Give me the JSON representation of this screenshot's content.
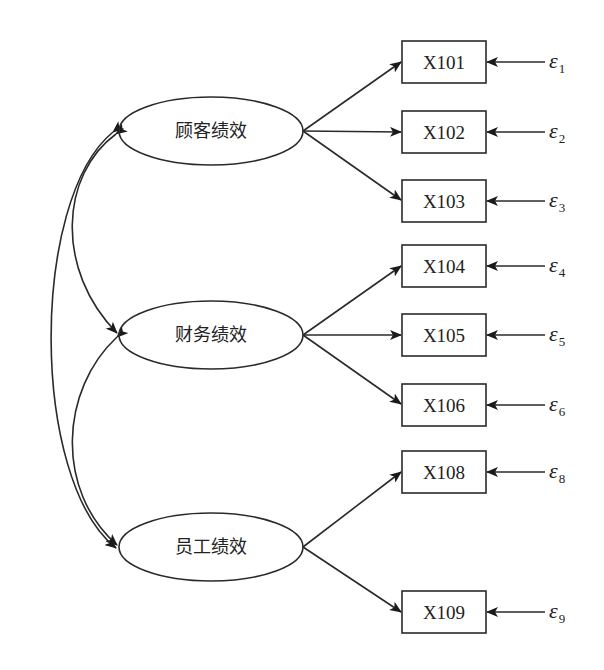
{
  "diagram": {
    "type": "structural-equation-model",
    "latent_variables": [
      {
        "id": "customer",
        "label": "顾客绩效",
        "cx": 211,
        "cy": 131,
        "indicators": [
          "X101",
          "X102",
          "X103"
        ]
      },
      {
        "id": "finance",
        "label": "财务绩效",
        "cx": 211,
        "cy": 335,
        "indicators": [
          "X104",
          "X105",
          "X106"
        ]
      },
      {
        "id": "employee",
        "label": "员工绩效",
        "cx": 211,
        "cy": 547,
        "indicators": [
          "X108",
          "X109"
        ]
      }
    ],
    "observed_variables": [
      {
        "label": "X101",
        "y": 41,
        "error": "ε",
        "error_sub": "1"
      },
      {
        "label": "X102",
        "y": 111,
        "error": "ε",
        "error_sub": "2"
      },
      {
        "label": "X103",
        "y": 180,
        "error": "ε",
        "error_sub": "3"
      },
      {
        "label": "X104",
        "y": 245,
        "error": "ε",
        "error_sub": "4"
      },
      {
        "label": "X105",
        "y": 314,
        "error": "ε",
        "error_sub": "5"
      },
      {
        "label": "X106",
        "y": 384,
        "error": "ε",
        "error_sub": "6"
      },
      {
        "label": "X108",
        "y": 451,
        "error": "ε",
        "error_sub": "8"
      },
      {
        "label": "X109",
        "y": 591,
        "error": "ε",
        "error_sub": "9"
      }
    ],
    "covariances": [
      {
        "from": "顾客绩效",
        "to": "财务绩效"
      },
      {
        "from": "财务绩效",
        "to": "员工绩效"
      },
      {
        "from": "顾客绩效",
        "to": "员工绩效"
      }
    ]
  }
}
